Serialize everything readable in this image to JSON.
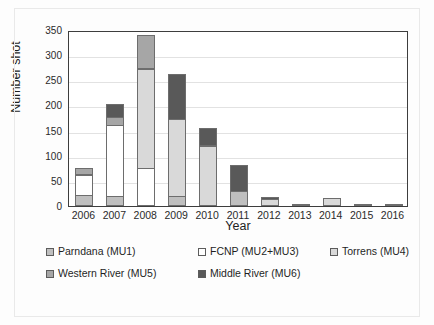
{
  "chart_data": {
    "type": "bar",
    "subtype": "stacked-bar",
    "title": "",
    "xlabel": "Year",
    "ylabel": "Number shot",
    "categories": [
      "2006",
      "2007",
      "2008",
      "2009",
      "2010",
      "2011",
      "2012",
      "2013",
      "2014",
      "2015",
      "2016"
    ],
    "ylim": [
      0,
      350
    ],
    "yticks": [
      0,
      50,
      100,
      150,
      200,
      250,
      300,
      350
    ],
    "grid": true,
    "legend_position": "bottom",
    "series": [
      {
        "name": "Parndana (MU1)",
        "color": "#bfbfbf",
        "values": [
          22,
          20,
          0,
          20,
          0,
          30,
          0,
          0,
          0,
          0,
          0
        ]
      },
      {
        "name": "FCNP (MU2+MU3)",
        "color": "#ffffff",
        "values": [
          42,
          142,
          75,
          0,
          0,
          0,
          0,
          0,
          0,
          0,
          0
        ]
      },
      {
        "name": "Torrens (MU4)",
        "color": "#d9d9d9",
        "values": [
          0,
          0,
          200,
          155,
          120,
          0,
          14,
          0,
          15,
          3,
          0
        ]
      },
      {
        "name": "Western River (MU5)",
        "color": "#a6a6a6",
        "values": [
          14,
          18,
          68,
          0,
          0,
          0,
          0,
          0,
          0,
          0,
          0
        ]
      },
      {
        "name": "Middle River (MU6)",
        "color": "#595959",
        "values": [
          0,
          28,
          0,
          90,
          36,
          54,
          5,
          3,
          0,
          0,
          2
        ]
      }
    ],
    "totals": [
      78,
      208,
      343,
      265,
      156,
      84,
      19,
      3,
      15,
      3,
      2
    ]
  },
  "axes": {
    "y_title": "Number shot",
    "x_title": "Year",
    "y_tick_labels": [
      "350",
      "300",
      "250",
      "200",
      "150",
      "100",
      "50",
      "0"
    ],
    "x_tick_labels": [
      "2006",
      "2007",
      "2008",
      "2009",
      "2010",
      "2011",
      "2012",
      "2013",
      "2014",
      "2015",
      "2016"
    ]
  },
  "legend": {
    "rows": [
      [
        {
          "label": "Parndana (MU1)",
          "color": "#bfbfbf"
        },
        {
          "label": "FCNP (MU2+MU3)",
          "color": "#ffffff"
        },
        {
          "label": "Torrens (MU4)",
          "color": "#d9d9d9"
        }
      ],
      [
        {
          "label": "Western River (MU5)",
          "color": "#a6a6a6"
        },
        {
          "label": "Middle River (MU6)",
          "color": "#595959"
        }
      ]
    ]
  }
}
